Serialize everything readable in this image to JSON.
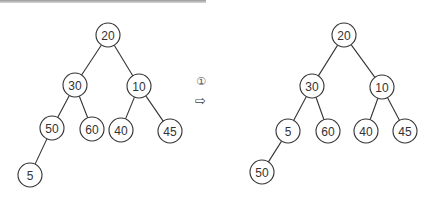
{
  "diagram": {
    "type": "binary-tree-transformation",
    "step_label": "①",
    "arrow_symbol": "⇨",
    "colors": {
      "stroke": "#333333",
      "fill": "#ffffff",
      "text": "#333333"
    },
    "before": {
      "nodes": [
        {
          "id": "b20",
          "label": "20",
          "x": 108,
          "y": 35
        },
        {
          "id": "b30",
          "label": "30",
          "x": 75,
          "y": 85
        },
        {
          "id": "b10",
          "label": "10",
          "x": 139,
          "y": 86
        },
        {
          "id": "b50",
          "label": "50",
          "x": 52,
          "y": 128
        },
        {
          "id": "b60",
          "label": "60",
          "x": 92,
          "y": 129
        },
        {
          "id": "b40",
          "label": "40",
          "x": 121,
          "y": 130
        },
        {
          "id": "b45",
          "label": "45",
          "x": 170,
          "y": 131
        },
        {
          "id": "b5",
          "label": "5",
          "x": 30,
          "y": 175
        }
      ],
      "edges": [
        [
          "b20",
          "b30"
        ],
        [
          "b20",
          "b10"
        ],
        [
          "b30",
          "b50"
        ],
        [
          "b30",
          "b60"
        ],
        [
          "b10",
          "b40"
        ],
        [
          "b10",
          "b45"
        ],
        [
          "b50",
          "b5"
        ]
      ]
    },
    "after": {
      "nodes": [
        {
          "id": "a20",
          "label": "20",
          "x": 344,
          "y": 35
        },
        {
          "id": "a30",
          "label": "30",
          "x": 312,
          "y": 86
        },
        {
          "id": "a10",
          "label": "10",
          "x": 382,
          "y": 87
        },
        {
          "id": "a5",
          "label": "5",
          "x": 288,
          "y": 131
        },
        {
          "id": "a60",
          "label": "60",
          "x": 328,
          "y": 131
        },
        {
          "id": "a40",
          "label": "40",
          "x": 366,
          "y": 131
        },
        {
          "id": "a45",
          "label": "45",
          "x": 405,
          "y": 131
        },
        {
          "id": "a50",
          "label": "50",
          "x": 262,
          "y": 172
        }
      ],
      "edges": [
        [
          "a20",
          "a30"
        ],
        [
          "a20",
          "a10"
        ],
        [
          "a30",
          "a5"
        ],
        [
          "a30",
          "a60"
        ],
        [
          "a10",
          "a40"
        ],
        [
          "a10",
          "a45"
        ],
        [
          "a5",
          "a50"
        ]
      ]
    }
  }
}
